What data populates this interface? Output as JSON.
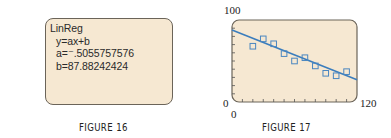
{
  "figure16": {
    "caption": "FIGURE 16",
    "screen_lines": [
      "LinReg",
      "y=ax+b",
      "a=⁻.5055757576",
      "b=87.88242424"
    ],
    "background_color": "#f6e8d2"
  },
  "figure17": {
    "caption": "FIGURE 17",
    "y_max_label": "100",
    "y_min_label": "0",
    "x_min_label": "0",
    "x_max_label": "120"
  },
  "chart_data": {
    "type": "scatter",
    "title": "",
    "xlabel": "",
    "ylabel": "",
    "xlim": [
      0,
      120
    ],
    "ylim": [
      0,
      100
    ],
    "grid": false,
    "x_ticks_every": 10,
    "y_ticks_every": 10,
    "series": [
      {
        "name": "data",
        "marker": "square",
        "color": "#4a86c0",
        "x": [
          20,
          30,
          40,
          50,
          60,
          70,
          80,
          90,
          100,
          110
        ],
        "y": [
          68,
          77,
          71,
          59,
          50,
          54,
          44,
          35,
          32,
          37
        ]
      },
      {
        "name": "regression line y=ax+b",
        "type": "line",
        "color": "#3b7dbd",
        "a": -0.5055757576,
        "b": 87.88242424
      }
    ],
    "plot_background": "#f6e8d2"
  }
}
